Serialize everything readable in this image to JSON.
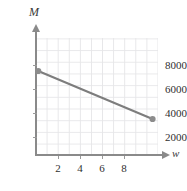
{
  "chart_data": {
    "type": "line",
    "title": "",
    "subtitle": "",
    "xlabel": "w",
    "ylabel": "M",
    "xlim": [
      0,
      11.6
    ],
    "ylim": [
      0,
      9800
    ],
    "grid": true,
    "legend": null,
    "x_ticks": [
      2,
      4,
      6,
      8
    ],
    "x_tick_labels": [
      "2",
      "4",
      "6",
      "8"
    ],
    "y_ticks": [
      2000,
      4000,
      6000,
      8000
    ],
    "y_tick_labels": [
      "2000",
      "4000",
      "6000",
      "8000"
    ],
    "series": [
      {
        "name": "M",
        "marker": "circle",
        "color": "#7d7d7d",
        "x": [
          0.2,
          10.5
        ],
        "y": [
          7000,
          3000
        ],
        "points": [
          {
            "w": 0.2,
            "M": 7000
          },
          {
            "w": 10.5,
            "M": 3000
          }
        ]
      }
    ],
    "annotations": []
  },
  "axes": {
    "y_name": "M",
    "x_name": "w"
  },
  "colors": {
    "data_line": "#7d7d7d",
    "marker": "#8c8c8c",
    "axis": "#8a8a8a",
    "grid": "#e7e7e9",
    "tick_text": "#2f2f2f"
  }
}
